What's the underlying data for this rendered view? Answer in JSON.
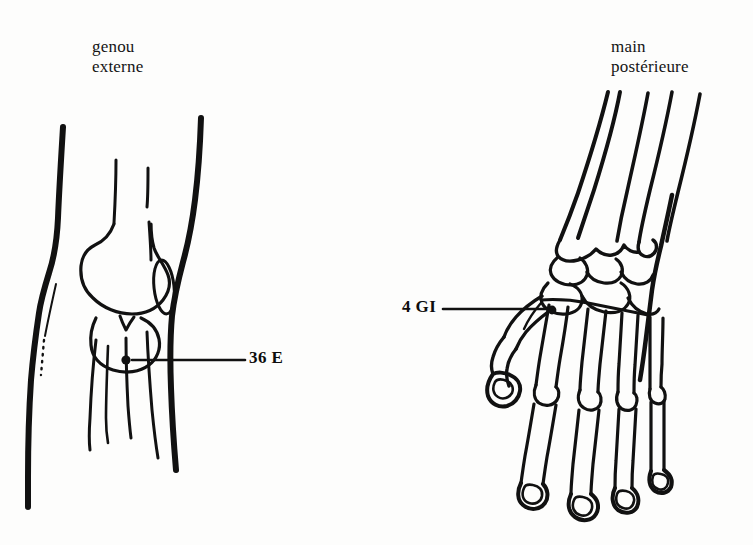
{
  "page": {
    "background_color": "#fdfdfc",
    "ink_color": "#111111",
    "width": 753,
    "height": 545
  },
  "figures": {
    "knee": {
      "caption_line1": "genou",
      "caption_line2": "externe",
      "caption_text": "genou\nexterne",
      "point": {
        "label": "36 E",
        "dot_x": 126,
        "dot_y": 360,
        "leader_from_x": 132,
        "leader_to_x": 245,
        "leader_y": 360
      },
      "structures": [
        "femur-shaft",
        "femoral-condyle",
        "patella",
        "tibia",
        "fibula",
        "skin-contour-anterior",
        "skin-contour-posterior",
        "dotted-guide-line"
      ]
    },
    "hand": {
      "caption_line1": "main",
      "caption_line2": "postérieure",
      "caption_text": "main\npostérieure",
      "point": {
        "label": "4 GI",
        "dot_x": 552,
        "dot_y": 310,
        "leader_from_x": 443,
        "leader_to_x": 550,
        "leader_y": 309
      },
      "structures": [
        "radius",
        "ulna",
        "carpal-bones",
        "metacarpals",
        "phalanges",
        "thumb",
        "hand-contour"
      ]
    }
  }
}
